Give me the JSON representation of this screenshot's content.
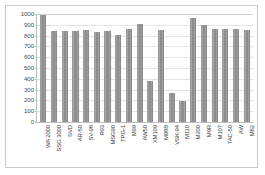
{
  "chart_data": {
    "type": "bar",
    "title": "",
    "xlabel": "",
    "ylabel": "",
    "ylim": [
      0,
      1000
    ],
    "ytick_values": [
      1000,
      900,
      800,
      700,
      600,
      500,
      400,
      300,
      200,
      100,
      0
    ],
    "ytick_labels": [
      "1000",
      "900",
      "800",
      "700",
      "600",
      "500",
      "400",
      "300",
      "200",
      "100",
      "0"
    ],
    "grid": true,
    "legend": "none",
    "bar_color": "#8c8c8c",
    "categories": [
      "WA 2000",
      "SSG 3000",
      "SVD",
      "AR-50",
      "SV-98",
      "R93",
      "MSG90",
      "TPG-1",
      "M99",
      "AW50",
      "XM109",
      "M98B",
      "VSK-94",
      "M110",
      "M200",
      "M9R",
      "M107",
      "TAC-50",
      "AW",
      "M82"
    ],
    "values": [
      990,
      840,
      840,
      840,
      850,
      830,
      840,
      810,
      860,
      910,
      380,
      850,
      270,
      190,
      960,
      900,
      860,
      860,
      860,
      850
    ]
  }
}
